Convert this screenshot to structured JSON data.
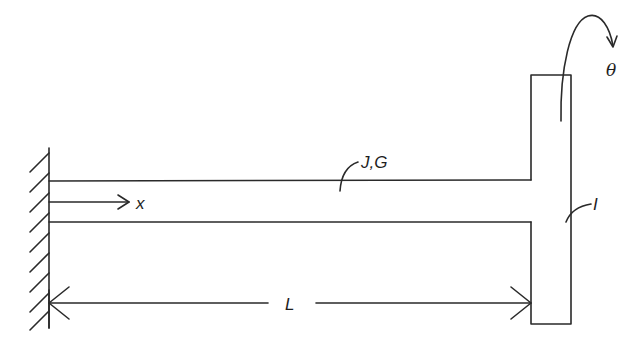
{
  "diagram": {
    "labels": {
      "axis": "x",
      "shaft_properties": "J,G",
      "disk_inertia": "I",
      "rotation": "θ",
      "length": "L"
    },
    "components": [
      {
        "name": "fixed-wall",
        "type": "ground support"
      },
      {
        "name": "shaft",
        "properties": "J,G"
      },
      {
        "name": "disk",
        "properties": "I"
      },
      {
        "name": "rotation-arrow",
        "quantity": "θ"
      },
      {
        "name": "length-dimension",
        "quantity": "L"
      }
    ],
    "colors": {
      "line": "#2a2a2a",
      "background": "#ffffff"
    }
  }
}
